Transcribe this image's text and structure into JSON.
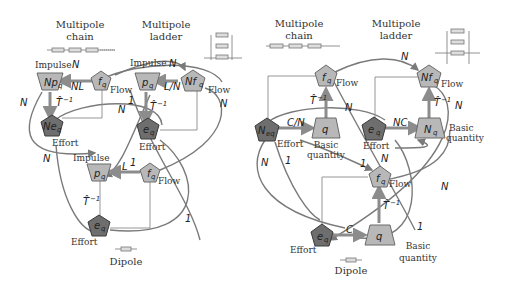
{
  "left_panel": {
    "titles": {
      "chain": [
        "Multipole",
        "chain"
      ],
      "ladder": [
        "Multipole",
        "ladder"
      ],
      "dipole": "Dipole"
    },
    "nodes": {
      "Np_q": {
        "main": "Np",
        "sub": "q",
        "role": "Impulse"
      },
      "f_q_top": {
        "main": "f",
        "sub": "q",
        "role": "Flow"
      },
      "p_q_top": {
        "main": "p",
        "sub": "q",
        "role": "Impulse"
      },
      "Nf_q": {
        "main": "Nf",
        "sub": "q",
        "role": "Flow"
      },
      "Ne_q": {
        "main": "Ne",
        "sub": "q",
        "role": "Effort"
      },
      "e_q_mid": {
        "main": "e",
        "sub": "q",
        "role": "Effort"
      },
      "p_q_bot": {
        "main": "p",
        "sub": "q",
        "role": "Impulse"
      },
      "f_q_bot": {
        "main": "f",
        "sub": "q",
        "role": "Flow"
      },
      "e_q_bot": {
        "main": "e",
        "sub": "q",
        "role": "Effort"
      }
    },
    "edge_labels": {
      "NL": "NL",
      "LN": "L/N",
      "L": "L",
      "N": "N",
      "one": "1",
      "T": "T̂",
      "Tsup": "−1"
    }
  },
  "right_panel": {
    "titles": {
      "chain": [
        "Multipole",
        "chain"
      ],
      "ladder": [
        "Multipole",
        "ladder"
      ],
      "dipole": "Dipole"
    },
    "nodes": {
      "f_q_top": {
        "main": "f",
        "sub": "q",
        "role": "Flow"
      },
      "Nf_q": {
        "main": "Nf",
        "sub": "q",
        "role": "Flow"
      },
      "N_eq": {
        "main": "N",
        "sub": "eq",
        "role": "Effort"
      },
      "q_top": {
        "main": "q",
        "sub": "",
        "role": [
          "Basic",
          "quantity"
        ]
      },
      "e_q_mid": {
        "main": "e",
        "sub": "q",
        "role": "Effort"
      },
      "N_q": {
        "main": "N",
        "sub": "q",
        "role": [
          "Basic",
          "quantity"
        ]
      },
      "f_q_bot": {
        "main": "f",
        "sub": "q",
        "role": "Flow"
      },
      "e_q_bot": {
        "main": "e",
        "sub": "q",
        "role": "Effort"
      },
      "q_bot": {
        "main": "q",
        "sub": "",
        "role": [
          "Basic",
          "quantity"
        ]
      }
    },
    "edge_labels": {
      "CN": "C/N",
      "NC": "NC",
      "C": "C",
      "N": "N",
      "one": "1",
      "T": "T̂",
      "Tsup": "−1"
    }
  }
}
